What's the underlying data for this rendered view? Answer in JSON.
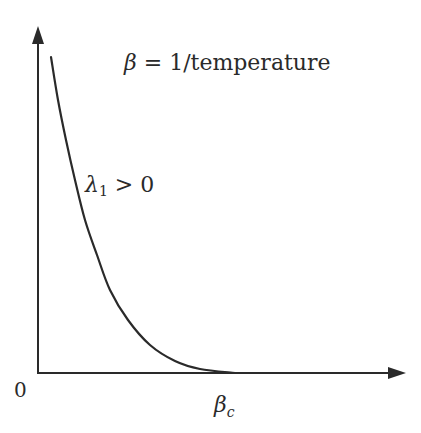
{
  "chart_data": {
    "type": "line",
    "title": "β = 1/temperature",
    "xlabel": "β",
    "ylabel": "",
    "x_ticks": [
      {
        "value": 0,
        "label": "0"
      },
      {
        "value": "β_c",
        "label": "β_c"
      }
    ],
    "series": [
      {
        "name": "λ1 > 0",
        "description": "Decreasing convex curve that reaches zero at β_c and stays at zero afterward",
        "points_px": [
          [
            51,
            57
          ],
          [
            58,
            100
          ],
          [
            66,
            140
          ],
          [
            75,
            180
          ],
          [
            85,
            220
          ],
          [
            97,
            255
          ],
          [
            110,
            290
          ],
          [
            128,
            320
          ],
          [
            150,
            345
          ],
          [
            175,
            361
          ],
          [
            200,
            369
          ],
          [
            235,
            373
          ]
        ]
      }
    ],
    "axes": {
      "arrows": true,
      "grid": false
    }
  },
  "labels": {
    "title_beta": "β",
    "title_rest": " = 1/temperature",
    "curve_lambda": "λ",
    "curve_sub": "1",
    "curve_rest": " > 0",
    "origin": "0",
    "beta_c_main": "β",
    "beta_c_sub": "c"
  },
  "colors": {
    "line": "#2a2a2a",
    "background": "#ffffff"
  }
}
